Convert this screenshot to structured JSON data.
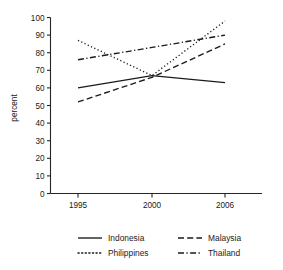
{
  "chart_data": {
    "type": "line",
    "title": "",
    "subtitle": "",
    "xlabel": "",
    "ylabel": "percent",
    "x": [
      1995,
      2000,
      2006
    ],
    "categories": [
      "1995",
      "2000",
      "2006"
    ],
    "xtick_labels": [
      "1995",
      "2000",
      "2006"
    ],
    "ytick_labels": [
      "0",
      "10",
      "20",
      "30",
      "40",
      "50",
      "60",
      "70",
      "80",
      "90",
      "100"
    ],
    "ytick_values": [
      0,
      10,
      20,
      30,
      40,
      50,
      60,
      70,
      80,
      90,
      100
    ],
    "ylim": [
      0,
      100
    ],
    "grid": false,
    "legend_position": "bottom",
    "series": [
      {
        "name": "Indonesia",
        "style": "solid",
        "values": [
          60,
          67,
          63
        ]
      },
      {
        "name": "Malaysia",
        "style": "dashed",
        "values": [
          52,
          66,
          85
        ]
      },
      {
        "name": "Philippines",
        "style": "dotted",
        "values": [
          87,
          67,
          98
        ]
      },
      {
        "name": "Thailand",
        "style": "dashdot",
        "values": [
          76,
          83,
          90
        ]
      }
    ]
  },
  "legend": {
    "entries": [
      {
        "label": "Indonesia",
        "style": "solid"
      },
      {
        "label": "Malaysia",
        "style": "dashed"
      },
      {
        "label": "Philippines",
        "style": "dotted"
      },
      {
        "label": "Thailand",
        "style": "dashdot"
      }
    ]
  },
  "axes": {
    "y_title": "percent"
  },
  "colors": {
    "ink": "#1a1a1a",
    "axis": "#262626",
    "background": "#ffffff"
  }
}
